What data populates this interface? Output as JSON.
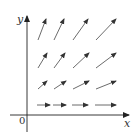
{
  "figure": {
    "type": "vector-field",
    "labels": {
      "x_axis": "x",
      "y_axis": "y",
      "origin": "0"
    },
    "colors": {
      "axis": "#222222",
      "arrow": "#5a5a5a",
      "arrowhead": "#333333",
      "label": "#333333"
    },
    "axes": {
      "origin_px": [
        27,
        115
      ],
      "x_axis_px": [
        10,
        129
      ],
      "y_axis_px": [
        132,
        16
      ]
    },
    "vectors": [
      {
        "row": 1,
        "col": 1,
        "tail": [
          37,
          105
        ],
        "head": [
          50,
          105
        ]
      },
      {
        "row": 1,
        "col": 2,
        "tail": [
          53,
          105
        ],
        "head": [
          66,
          105
        ]
      },
      {
        "row": 1,
        "col": 3,
        "tail": [
          72,
          105
        ],
        "head": [
          88,
          105
        ]
      },
      {
        "row": 1,
        "col": 4,
        "tail": [
          95,
          105
        ],
        "head": [
          116,
          105
        ]
      },
      {
        "row": 2,
        "col": 1,
        "tail": [
          38,
          89
        ],
        "head": [
          47,
          81
        ]
      },
      {
        "row": 2,
        "col": 2,
        "tail": [
          54,
          89
        ],
        "head": [
          66,
          81
        ]
      },
      {
        "row": 2,
        "col": 3,
        "tail": [
          73,
          89
        ],
        "head": [
          89,
          81
        ]
      },
      {
        "row": 2,
        "col": 4,
        "tail": [
          96,
          89
        ],
        "head": [
          116,
          81
        ]
      },
      {
        "row": 3,
        "col": 1,
        "tail": [
          38,
          68
        ],
        "head": [
          47,
          53
        ]
      },
      {
        "row": 3,
        "col": 2,
        "tail": [
          54,
          68
        ],
        "head": [
          65,
          53
        ]
      },
      {
        "row": 3,
        "col": 3,
        "tail": [
          73,
          68
        ],
        "head": [
          89,
          53
        ]
      },
      {
        "row": 3,
        "col": 4,
        "tail": [
          96,
          68
        ],
        "head": [
          116,
          53
        ]
      },
      {
        "row": 4,
        "col": 1,
        "tail": [
          38,
          40
        ],
        "head": [
          46,
          19
        ]
      },
      {
        "row": 4,
        "col": 2,
        "tail": [
          54,
          40
        ],
        "head": [
          64,
          19
        ]
      },
      {
        "row": 4,
        "col": 3,
        "tail": [
          73,
          40
        ],
        "head": [
          88,
          19
        ]
      },
      {
        "row": 4,
        "col": 4,
        "tail": [
          96,
          40
        ],
        "head": [
          116,
          19
        ]
      }
    ]
  }
}
